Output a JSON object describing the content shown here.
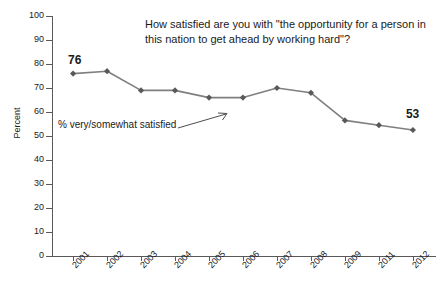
{
  "chart_data": {
    "type": "line",
    "title": "How satisfied are you with \"the opportunity for a person in this nation to get ahead by working hard\"?",
    "xlabel": "",
    "ylabel": "Percent",
    "categories": [
      "2001",
      "2002",
      "2003",
      "2004",
      "2005",
      "2006",
      "2007",
      "2008",
      "2009",
      "2011",
      "2012"
    ],
    "values": [
      76,
      77,
      69,
      69,
      66,
      66,
      70,
      68,
      56.5,
      54.5,
      52.5
    ],
    "series": [
      {
        "name": "% very/somewhat satisfied",
        "values": [
          76,
          77,
          69,
          69,
          66,
          66,
          70,
          68,
          56.5,
          54.5,
          52.5
        ]
      }
    ],
    "ylim": [
      0,
      100
    ],
    "ytick_labels": [
      "0",
      "10",
      "20",
      "30",
      "40",
      "50",
      "60",
      "70",
      "80",
      "90",
      "100"
    ],
    "ytick_values": [
      0,
      10,
      20,
      30,
      40,
      50,
      60,
      70,
      80,
      90,
      100
    ],
    "grid": false,
    "legend": false,
    "legend_position": "none",
    "marker": "diamond",
    "line_color": "#7f7f7f",
    "marker_color": "#595959",
    "annotations": [
      {
        "text": "76",
        "category": "2001",
        "value": 76,
        "position": "above-left"
      },
      {
        "text": "53",
        "category": "2012",
        "value": 52.5,
        "position": "above-right"
      },
      {
        "text": "% very/somewhat satisfied",
        "position": "inside-left",
        "arrow": true
      }
    ]
  },
  "axis": {
    "y_title": "Percent",
    "y_ticks": [
      "100",
      "90",
      "80",
      "70",
      "60",
      "50",
      "40",
      "30",
      "20",
      "10",
      "0"
    ],
    "x_ticks": [
      "2001",
      "2002",
      "2003",
      "2004",
      "2005",
      "2006",
      "2007",
      "2008",
      "2009",
      "2011",
      "2012"
    ]
  },
  "labels": {
    "title": "How satisfied are you with \"the opportunity for a person in this nation to get ahead by working hard\"?",
    "series_annotation": "% very/somewhat satisfied",
    "first_point": "76",
    "last_point": "53"
  },
  "colors": {
    "line": "#7f7f7f",
    "marker": "#595959",
    "axis": "#595959",
    "text": "#1a1a1a",
    "background": "#ffffff"
  }
}
